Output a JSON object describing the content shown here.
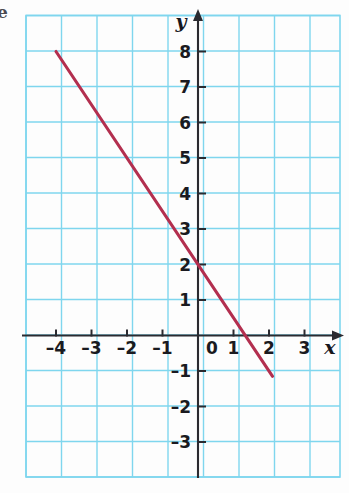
{
  "figure": {
    "margin_letter": "e",
    "background": "#fdfdfd",
    "grid_color": "#7fd6ee",
    "axis_color": "#2a2a30",
    "line_color": "#b32f4f"
  },
  "chart_data": {
    "type": "line",
    "title": "",
    "subtitle": "",
    "xlabel": "x",
    "ylabel": "y",
    "xlim": [
      -4.85,
      4.0
    ],
    "ylim": [
      -3.95,
      9.05
    ],
    "xticks": [
      -4,
      -3,
      -2,
      -1,
      0,
      1,
      2,
      3
    ],
    "yticks": [
      -3,
      -2,
      -1,
      1,
      2,
      3,
      4,
      5,
      6,
      7,
      8
    ],
    "xtick_labels": [
      "–4",
      "–3",
      "–2",
      "–1",
      "0",
      "1",
      "2",
      "3"
    ],
    "ytick_labels": [
      "–3",
      "–2",
      "–1",
      "1",
      "2",
      "3",
      "4",
      "5",
      "6",
      "7",
      "8"
    ],
    "grid": true,
    "grid_spacing": 1,
    "legend": null,
    "annotations": [],
    "series": [
      {
        "name": "line",
        "equation": "y = -1.5x + 2",
        "slope": -1.5,
        "intercept": 2,
        "color": "#b32f4f",
        "points": [
          {
            "x": -4,
            "y": 8
          },
          {
            "x": -2,
            "y": 5
          },
          {
            "x": 0,
            "y": 2
          },
          {
            "x": 1,
            "y": 0.5
          },
          {
            "x": 1.333,
            "y": 0
          },
          {
            "x": 2,
            "y": -1
          }
        ],
        "x_start": -4,
        "y_start": 8,
        "x_end": 2.1,
        "y_end": -1.15
      }
    ]
  },
  "axes": {
    "x_axis_label": "x",
    "y_axis_label": "y",
    "origin_label": "0",
    "x_arrow": true,
    "y_arrow": true
  }
}
